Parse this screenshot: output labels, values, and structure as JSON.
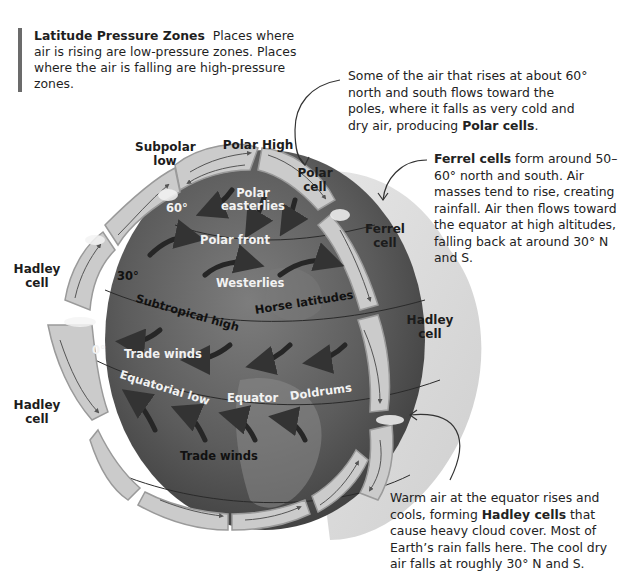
{
  "intro": {
    "title": "Latitude Pressure Zones",
    "text": "Places where air is rising are low-pressure zones. Places where the air is falling are high-pressure zones."
  },
  "notes": {
    "polar": {
      "pre": "Some of the air that rises at about 60° north and south flows toward the poles, where it falls as very cold and dry air, producing ",
      "bold": "Polar cells",
      "post": "."
    },
    "ferrel": {
      "bold": "Ferrel cells",
      "post": " form around 50–60° north and south. Air masses tend to rise, creating rainfall. Air then flows toward the equator at high altitudes, falling back at around 30° N and S."
    },
    "hadley": {
      "pre": "Warm air at the equator rises and cools, forming ",
      "bold": "Hadley cells",
      "post": " that cause heavy cloud cover. Most of Earth’s rain falls here. The cool dry air falls at roughly 30° N and S."
    }
  },
  "labels": {
    "subpolar_low_1": "Subpolar",
    "subpolar_low_2": "low",
    "polar_high": "Polar High",
    "polar_cell_1": "Polar",
    "polar_cell_2": "cell",
    "ferrel_cell_1": "Ferrel",
    "ferrel_cell_2": "cell",
    "hadley_left_top_1": "Hadley",
    "hadley_left_top_2": "cell",
    "hadley_right_1": "Hadley",
    "hadley_right_2": "cell",
    "hadley_left_bottom_1": "Hadley",
    "hadley_left_bottom_2": "cell"
  },
  "globe": {
    "lat_60": "60°",
    "lat_30": "30°",
    "lat_0": "0°",
    "polar_easterlies_1": "Polar",
    "polar_easterlies_2": "easterlies",
    "polar_front": "Polar front",
    "westerlies": "Westerlies",
    "subtropical_high": "Subtropical high",
    "horse_latitudes": "Horse latitudes",
    "trade_winds_north": "Trade winds",
    "equatorial_low": "Equatorial low",
    "equator": "Equator",
    "doldrums": "Doldrums",
    "trade_winds_south": "Trade winds"
  },
  "colors": {
    "globe_dark": "#4a4a4a",
    "globe_mid": "#6e6e6e",
    "cell_fill": "#c9c9c9",
    "shell_fill": "#dcdcdc",
    "accent_bar": "#6b6b6b"
  }
}
